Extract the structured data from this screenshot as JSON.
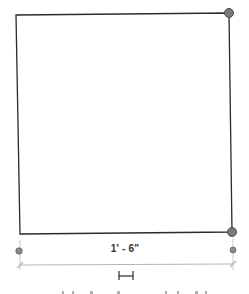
{
  "drawing": {
    "element": "rectangle",
    "dimension_label": "1' - 6\"",
    "colors": {
      "outline": "#2b2b2b",
      "grip": "#7a7a7a",
      "grip_stroke": "#4a4a4a",
      "dimension_line": "#b5b5b5",
      "witness_dot": "#8a8a8a"
    },
    "icons": {
      "dimension_toggle": "horizontal-span-icon",
      "grip": "circle-grip"
    }
  }
}
